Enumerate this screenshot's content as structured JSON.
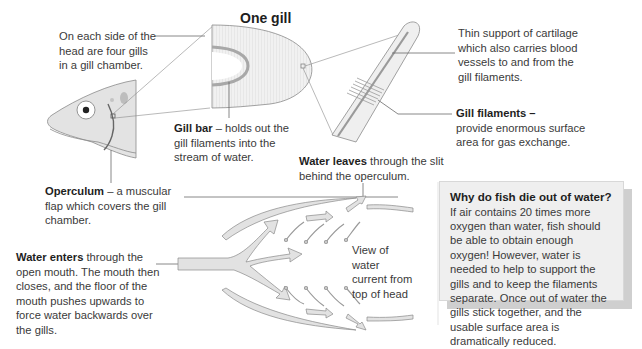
{
  "diagram": {
    "title": "One gill",
    "labels": {
      "gill_chamber": "On each side of the head are four gills in a gill chamber.",
      "gill_bar_bold": "Gill bar",
      "gill_bar_text": " – holds out the gill filaments into the stream of water.",
      "cartilage": "Thin support of cartilage which also carries blood vessels to and from the gill filaments.",
      "filaments_bold": "Gill filaments –",
      "filaments_text": "provide enormous surface area for gas exchange.",
      "operculum_bold": "Operculum",
      "operculum_text": " – a muscular flap which covers the gill chamber.",
      "water_leaves_bold": "Water leaves",
      "water_leaves_text": " through the slit behind the operculum.",
      "water_enters_bold": "Water enters",
      "water_enters_text": " through the open mouth. The mouth then closes, and the floor of the mouth pushes upwards to force water backwards over the gills.",
      "view_caption": "View of water current from top of head"
    },
    "info_box": {
      "heading": "Why do fish die out of water?",
      "body": "If air contains 20 times more oxygen than water, fish should be able to obtain enough oxygen! However, water is needed to help to support the gills and to keep the filaments separate. Once out of water the gills stick together, and the usable surface area is dramatically reduced."
    },
    "colors": {
      "line": "#6a6a6a",
      "fill_light": "#e6e6e6",
      "fill_mid": "#cfcfcf",
      "text": "#3a3a3a"
    }
  }
}
